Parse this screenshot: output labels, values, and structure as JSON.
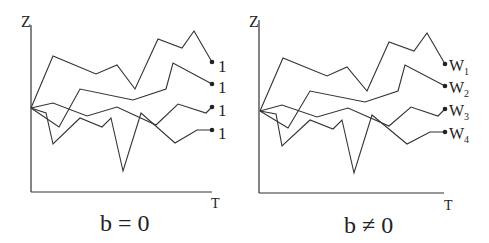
{
  "panels": [
    {
      "id": "left",
      "y_axis_label": "Z",
      "x_axis_label": "T",
      "caption": "b = 0",
      "end_labels": [
        "1",
        "1",
        "1",
        "1"
      ]
    },
    {
      "id": "right",
      "y_axis_label": "Z",
      "x_axis_label": "T",
      "caption": "b ≠ 0",
      "end_labels": [
        {
          "base": "W",
          "sub": "1"
        },
        {
          "base": "W",
          "sub": "2"
        },
        {
          "base": "W",
          "sub": "3"
        },
        {
          "base": "W",
          "sub": "4"
        }
      ]
    }
  ],
  "colors": {
    "line": "#333333",
    "background": "#ffffff"
  }
}
